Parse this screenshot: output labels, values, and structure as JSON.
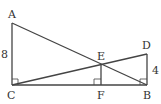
{
  "diagram": {
    "points": {
      "A": {
        "label": "A",
        "x": 12,
        "y": 23
      },
      "C": {
        "label": "C",
        "x": 12,
        "y": 85
      },
      "B": {
        "label": "B",
        "x": 147,
        "y": 85
      },
      "D": {
        "label": "D",
        "x": 147,
        "y": 54
      },
      "E": {
        "label": "E",
        "x": 101,
        "y": 64
      },
      "F": {
        "label": "F",
        "x": 101,
        "y": 85
      }
    },
    "lengths": {
      "AC": "8",
      "DB": "4"
    },
    "segments": [
      "AC",
      "CB",
      "AB",
      "CD",
      "DB",
      "EF"
    ],
    "right_angles": [
      "C",
      "F",
      "B"
    ],
    "stroke_color": "#444444"
  }
}
